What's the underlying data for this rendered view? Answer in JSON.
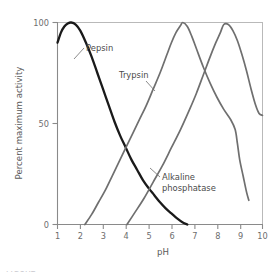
{
  "chart_data": {
    "type": "line",
    "title": "",
    "xlabel": "pH",
    "ylabel": "Percent maximum activity",
    "xlim": [
      1,
      10
    ],
    "ylim": [
      0,
      100
    ],
    "grid": false,
    "legend_position": "inline-labels",
    "x_ticks": [
      "1",
      "2",
      "3",
      "4",
      "5",
      "6",
      "7",
      "8",
      "9",
      "10"
    ],
    "y_ticks": [
      "0",
      "50",
      "100"
    ],
    "series": [
      {
        "name": "Pepsin",
        "color": "#1a1a1a",
        "x": [
          1.0,
          1.15,
          1.3,
          1.45,
          1.6,
          1.8,
          2.0,
          2.25,
          2.5,
          2.75,
          3.0,
          3.25,
          3.5,
          3.75,
          4.0,
          4.25,
          4.5,
          4.75,
          5.0,
          5.25,
          5.5,
          5.75,
          6.0,
          6.25,
          6.5,
          6.7
        ],
        "values": [
          90,
          95,
          98,
          99.5,
          100,
          99,
          96,
          90,
          83,
          75,
          67,
          59,
          51,
          44,
          38,
          32,
          27,
          22,
          18,
          14.5,
          11,
          8,
          5.5,
          3,
          1,
          0
        ]
      },
      {
        "name": "Trypsin",
        "color": "#6f6f6f",
        "x": [
          2.2,
          2.5,
          2.8,
          3.1,
          3.4,
          3.7,
          4.0,
          4.3,
          4.6,
          4.9,
          5.2,
          5.5,
          5.8,
          6.0,
          6.2,
          6.4,
          6.5,
          6.7,
          6.9,
          7.1,
          7.4,
          7.7,
          8.0,
          8.3,
          8.6,
          8.8,
          8.9,
          9.0,
          9.15,
          9.3,
          9.4
        ],
        "values": [
          0,
          5,
          11,
          17,
          24,
          31,
          38,
          45,
          52,
          59,
          67,
          75,
          84,
          90,
          95,
          98.5,
          100,
          98,
          93,
          87,
          78,
          70,
          63,
          57,
          52,
          47,
          40,
          32,
          24,
          16,
          12
        ]
      },
      {
        "name": "Alkaline phosphatase",
        "color": "#6f6f6f",
        "x": [
          4.05,
          4.4,
          4.8,
          5.2,
          5.6,
          6.0,
          6.4,
          6.8,
          7.1,
          7.4,
          7.7,
          7.95,
          8.15,
          8.3,
          8.5,
          8.7,
          8.9,
          9.1,
          9.3,
          9.5,
          9.7,
          9.85,
          10.0
        ],
        "values": [
          0,
          6,
          13,
          21,
          29,
          38,
          47,
          57,
          65,
          74,
          83,
          90,
          95,
          99,
          99,
          96,
          91,
          84,
          76,
          67,
          59,
          55,
          54
        ]
      }
    ],
    "annotations": [
      {
        "label": "Pepsin",
        "name": "pepsin-label",
        "lines": [
          "Pepsin"
        ],
        "text_x": 86,
        "text_y": 51,
        "leader": {
          "x1": 84,
          "y1": 48,
          "x2": 74,
          "y2": 59
        }
      },
      {
        "label": "Trypsin",
        "name": "trypsin-label",
        "lines": [
          "Trypsin"
        ],
        "text_x": 119,
        "text_y": 78,
        "leader": {
          "x1": 146,
          "y1": 81,
          "x2": 155,
          "y2": 91
        }
      },
      {
        "label": "Alkaline phosphatase",
        "name": "alkaline-phosphatase-label",
        "lines": [
          "Alkaline",
          "phosphatase"
        ],
        "text_x": 162,
        "text_y": 180,
        "leader": {
          "x1": 160,
          "y1": 177,
          "x2": 150,
          "y2": 168
        }
      }
    ]
  },
  "figure": {
    "caption_sliver": "FIGURE"
  }
}
